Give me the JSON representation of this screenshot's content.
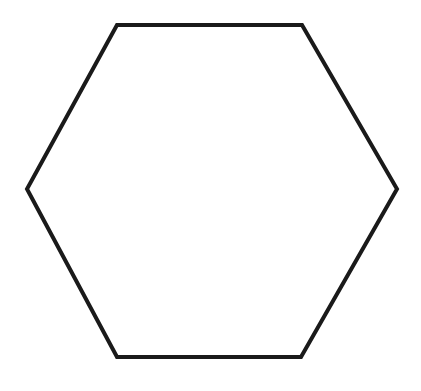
{
  "diagram": {
    "shape": "hexagon",
    "background": "#ffffff",
    "stroke_color": "#1a1a1a",
    "stroke_width": 4,
    "fill": "none",
    "vertices": [
      [
        117,
        25
      ],
      [
        302,
        25
      ],
      [
        397,
        189
      ],
      [
        301,
        357
      ],
      [
        117,
        357
      ],
      [
        27,
        189
      ]
    ]
  }
}
